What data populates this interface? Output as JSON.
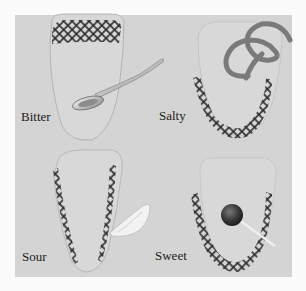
{
  "figure": {
    "background_color": "#d4d4d4",
    "tongue_outline_color": "#b8b8b8",
    "receptor_pattern_color": "#2a2a2a",
    "panels": [
      {
        "id": "bitter",
        "label": "Bitter",
        "region": "back of tongue",
        "object": "spoon"
      },
      {
        "id": "salty",
        "label": "Salty",
        "region": "sides and tip of tongue",
        "object": "pretzel"
      },
      {
        "id": "sour",
        "label": "Sour",
        "region": "sides of tongue",
        "object": "lemon wedge"
      },
      {
        "id": "sweet",
        "label": "Sweet",
        "region": "tip of tongue",
        "object": "lollipop"
      }
    ]
  }
}
